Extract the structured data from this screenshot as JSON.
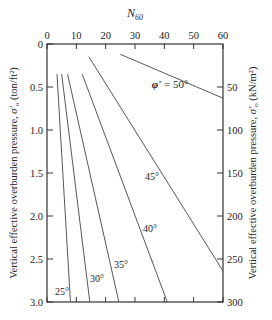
{
  "chart_data": {
    "type": "line",
    "title": "",
    "top_axis_label": "N60",
    "xlabel": "N60",
    "ylabel_left": "Vertical effective overburden pressure, σ'o (ton/ft²)",
    "ylabel_right": "Vertical effective overburden pressure, σ'o (kN/m²)",
    "xlim": [
      0,
      60
    ],
    "ylim_left": [
      0,
      3.0
    ],
    "ylim_right": [
      0,
      300
    ],
    "x_ticks": [
      "0",
      "10",
      "20",
      "30",
      "40",
      "50",
      "60"
    ],
    "y_ticks_left": [
      "0",
      "0.5",
      "1.0",
      "1.5",
      "2.0",
      "2.5",
      "3.0"
    ],
    "y_ticks_right": [
      "50",
      "100",
      "150",
      "200",
      "250",
      "300"
    ],
    "y_inverted": true,
    "grid": false,
    "series": [
      {
        "name": "φ' = 25°",
        "label": "25°",
        "points": [
          [
            3.4,
            0.35
          ],
          [
            8.0,
            3.0
          ]
        ]
      },
      {
        "name": "φ' = 30°",
        "label": "30°",
        "points": [
          [
            5.0,
            0.35
          ],
          [
            14.6,
            3.0
          ]
        ]
      },
      {
        "name": "φ' = 35°",
        "label": "35°",
        "points": [
          [
            7.0,
            0.35
          ],
          [
            24.5,
            3.0
          ]
        ]
      },
      {
        "name": "φ' = 40°",
        "label": "40°",
        "points": [
          [
            12.0,
            0.35
          ],
          [
            41.0,
            3.0
          ]
        ]
      },
      {
        "name": "φ' = 45°",
        "label": "45°",
        "points": [
          [
            14.3,
            0.15
          ],
          [
            60.0,
            2.64
          ]
        ]
      },
      {
        "name": "φ' = 50°",
        "label": "φ' = 50°",
        "points": [
          [
            25.0,
            0.12
          ],
          [
            60.0,
            0.63
          ]
        ]
      }
    ]
  }
}
